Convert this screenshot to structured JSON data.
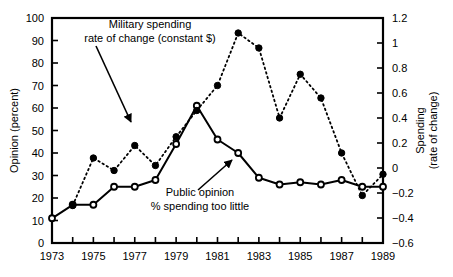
{
  "chart_data": {
    "type": "line",
    "title": "",
    "xlabel": "",
    "ylabel": "Opinion (percent)",
    "y2label": "Spending\n(rate of change)",
    "ylabel_line1": "Opinion (percent)",
    "y2label_line1": "Spending",
    "y2label_line2": "(rate of change)",
    "x": [
      1973,
      1974,
      1975,
      1976,
      1977,
      1978,
      1979,
      1980,
      1981,
      1982,
      1983,
      1984,
      1985,
      1986,
      1987,
      1988,
      1989
    ],
    "xlim": [
      1973,
      1989
    ],
    "ylim": [
      0,
      100
    ],
    "y2lim": [
      -0.6,
      1.2
    ],
    "xticks": [
      1973,
      1974,
      1975,
      1976,
      1977,
      1978,
      1979,
      1980,
      1981,
      1982,
      1983,
      1984,
      1985,
      1986,
      1987,
      1988,
      1989
    ],
    "xtick_labels": [
      "1973",
      "",
      "1975",
      "",
      "1977",
      "",
      "1979",
      "",
      "1981",
      "",
      "1983",
      "",
      "1985",
      "",
      "1987",
      "",
      "1989"
    ],
    "yticks": [
      0,
      10,
      20,
      30,
      40,
      50,
      60,
      70,
      80,
      90,
      100
    ],
    "ytick_labels": [
      "0",
      "10",
      "20",
      "30",
      "40",
      "50",
      "60",
      "70",
      "80",
      "90",
      "100"
    ],
    "y2ticks": [
      -0.6,
      -0.4,
      -0.2,
      0,
      0.2,
      0.4,
      0.6,
      0.8,
      1.0,
      1.2
    ],
    "y2tick_labels": [
      "-0.6",
      "-0.4",
      "-0.2",
      "0",
      "0.2",
      "0.4",
      "0.6",
      "0.8",
      "1",
      "1.2"
    ],
    "grid": false,
    "legend_position": "inline-annotations",
    "series": [
      {
        "name": "Public opinion % spending too little",
        "axis": "left",
        "style": "solid",
        "marker": "open-circle",
        "color": "#000000",
        "x": [
          1973,
          1974,
          1975,
          1976,
          1977,
          1978,
          1979,
          1980,
          1981,
          1982,
          1983,
          1984,
          1985,
          1986,
          1987,
          1988,
          1989
        ],
        "values": [
          11,
          17,
          17,
          25,
          25,
          28,
          44,
          61,
          46,
          40,
          29,
          26,
          27,
          26,
          28,
          25,
          25
        ]
      },
      {
        "name": "Military spending rate of change (constant $)",
        "axis": "right",
        "style": "dotted",
        "marker": "filled-circle",
        "color": "#000000",
        "x": [
          1974,
          1975,
          1976,
          1977,
          1978,
          1979,
          1980,
          1981,
          1982,
          1983,
          1984,
          1985,
          1986,
          1987,
          1988,
          1989
        ],
        "values": [
          -0.3,
          0.08,
          -0.02,
          0.18,
          0.02,
          0.25,
          0.46,
          0.66,
          1.08,
          0.96,
          0.4,
          0.75,
          0.56,
          0.12,
          -0.22,
          -0.05
        ]
      }
    ],
    "annotations": [
      {
        "name": "military-spending-annotation",
        "line1": "Military spending",
        "line2": "rate of change (constant $)",
        "text_x": 150,
        "text_y": 28,
        "arrow_from_x": 96,
        "arrow_from_y": 46,
        "arrow_to_x": 131,
        "arrow_to_y": 122
      },
      {
        "name": "public-opinion-annotation",
        "line1": "Public opinion",
        "line2": "% spending too little",
        "text_x": 200,
        "text_y": 196,
        "arrow_from_x": 198,
        "arrow_from_y": 190,
        "arrow_to_x": 232,
        "arrow_to_y": 160
      }
    ]
  }
}
